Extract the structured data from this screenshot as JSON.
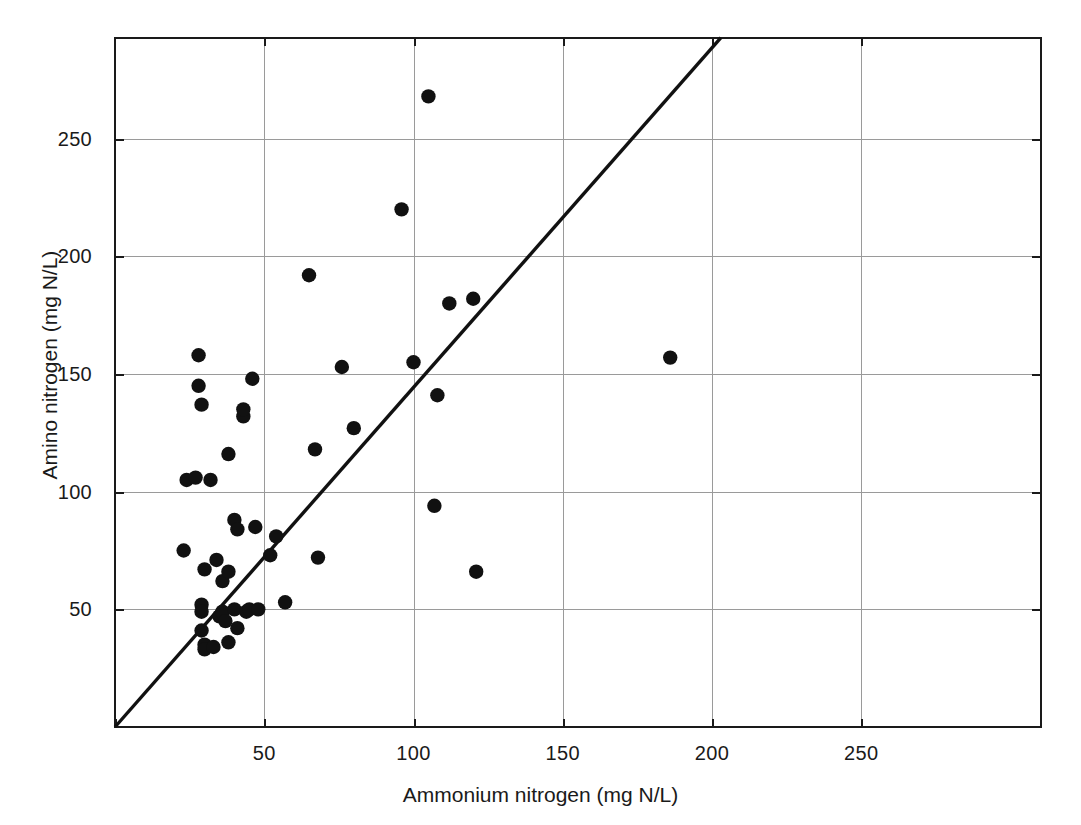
{
  "chart_data": {
    "type": "scatter",
    "title": "",
    "xlabel": "Ammonium nitrogen (mg N/L)",
    "ylabel": "Amino nitrogen (mg N/L)",
    "xlim": [
      0,
      310
    ],
    "ylim": [
      0,
      293
    ],
    "xticks": [
      50,
      100,
      150,
      200,
      250
    ],
    "yticks": [
      50,
      100,
      150,
      200,
      250
    ],
    "grid": true,
    "legend": null,
    "reference_line": {
      "name": "1:1 identity line",
      "type": "line",
      "slope": 1.5,
      "intercept": 0,
      "x_start": 0,
      "y_start": 0,
      "x_end": 203,
      "y_end": 293
    },
    "series": [
      {
        "name": "Samples",
        "marker": "filled-circle",
        "color": "#111111",
        "points": [
          [
            23,
            75
          ],
          [
            24,
            105
          ],
          [
            27,
            106
          ],
          [
            28,
            145
          ],
          [
            28,
            158
          ],
          [
            29,
            137
          ],
          [
            29,
            52
          ],
          [
            29,
            49
          ],
          [
            29,
            41
          ],
          [
            30,
            67
          ],
          [
            30,
            35
          ],
          [
            30,
            33
          ],
          [
            32,
            105
          ],
          [
            33,
            34
          ],
          [
            34,
            71
          ],
          [
            35,
            47
          ],
          [
            36,
            49
          ],
          [
            36,
            62
          ],
          [
            37,
            45
          ],
          [
            38,
            116
          ],
          [
            38,
            66
          ],
          [
            38,
            36
          ],
          [
            40,
            50
          ],
          [
            40,
            88
          ],
          [
            41,
            84
          ],
          [
            41,
            42
          ],
          [
            43,
            132
          ],
          [
            43,
            135
          ],
          [
            44,
            49
          ],
          [
            45,
            50
          ],
          [
            46,
            148
          ],
          [
            47,
            85
          ],
          [
            48,
            50
          ],
          [
            52,
            73
          ],
          [
            54,
            81
          ],
          [
            57,
            53
          ],
          [
            65,
            192
          ],
          [
            67,
            118
          ],
          [
            68,
            72
          ],
          [
            76,
            153
          ],
          [
            80,
            127
          ],
          [
            96,
            220
          ],
          [
            100,
            155
          ],
          [
            105,
            268
          ],
          [
            108,
            141
          ],
          [
            107,
            94
          ],
          [
            112,
            180
          ],
          [
            120,
            182
          ],
          [
            121,
            66
          ],
          [
            186,
            157
          ]
        ]
      }
    ]
  },
  "axes": {
    "x_tick_labels": [
      "50",
      "100",
      "150",
      "200",
      "250"
    ],
    "y_tick_labels": [
      "50",
      "100",
      "150",
      "200",
      "250"
    ],
    "x_title": "Ammonium nitrogen (mg N/L)",
    "y_title": "Amino nitrogen (mg N/L)"
  },
  "style": {
    "point_color": "#111111",
    "line_color": "#111111",
    "grid_color": "#9a9a9a",
    "axis_color": "#1a1a1a",
    "background": "#ffffff"
  }
}
